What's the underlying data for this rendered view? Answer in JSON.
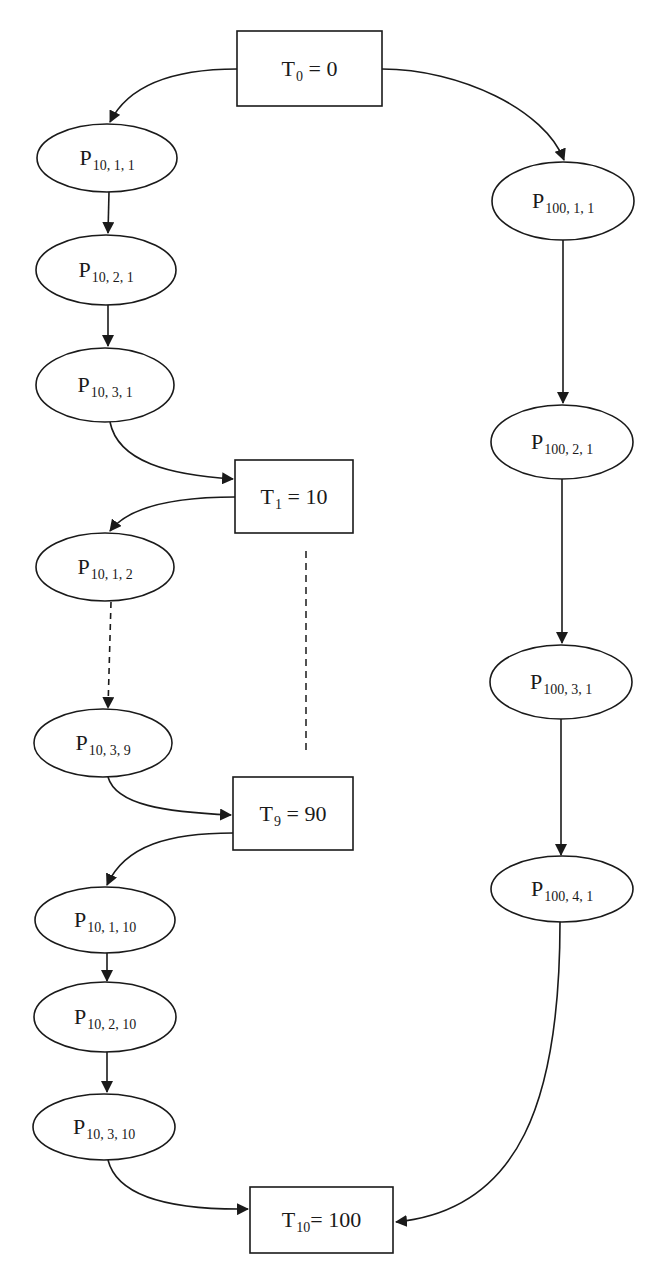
{
  "diagram": {
    "type": "flow",
    "colors": {
      "stroke": "#1a1a1a",
      "fill": "#ffffff",
      "background": "#ffffff"
    },
    "time_nodes": [
      {
        "id": "T0",
        "base": "T",
        "sub": "0",
        "rest": " = 0",
        "x": 237,
        "y": 31,
        "w": 145,
        "h": 75
      },
      {
        "id": "T1",
        "base": "T",
        "sub": "1",
        "rest": " = 10",
        "x": 235,
        "y": 460,
        "w": 118,
        "h": 73
      },
      {
        "id": "T9",
        "base": "T",
        "sub": "9",
        "rest": " = 90",
        "x": 233,
        "y": 777,
        "w": 120,
        "h": 73
      },
      {
        "id": "T10",
        "base": "T",
        "sub": "10",
        "rest": "= 100",
        "x": 250,
        "y": 1187,
        "w": 143,
        "h": 66
      }
    ],
    "process_nodes": [
      {
        "id": "P10_1_1",
        "base": "P",
        "sub": "10, 1, 1",
        "cx": 107,
        "cy": 158,
        "rx": 70,
        "ry": 34
      },
      {
        "id": "P10_2_1",
        "base": "P",
        "sub": "10, 2, 1",
        "cx": 106,
        "cy": 270,
        "rx": 70,
        "ry": 35
      },
      {
        "id": "P10_3_1",
        "base": "P",
        "sub": "10, 3, 1",
        "cx": 105,
        "cy": 385,
        "rx": 69,
        "ry": 37
      },
      {
        "id": "P10_1_2",
        "base": "P",
        "sub": "10, 1, 2",
        "cx": 105,
        "cy": 567,
        "rx": 69,
        "ry": 34
      },
      {
        "id": "P10_3_9",
        "base": "P",
        "sub": "10, 3, 9",
        "cx": 103,
        "cy": 743,
        "rx": 69,
        "ry": 34
      },
      {
        "id": "P10_1_10",
        "base": "P",
        "sub": "10, 1, 10",
        "cx": 105,
        "cy": 920,
        "rx": 70,
        "ry": 33
      },
      {
        "id": "P10_2_10",
        "base": "P",
        "sub": "10, 2, 10",
        "cx": 105,
        "cy": 1017,
        "rx": 71,
        "ry": 35
      },
      {
        "id": "P10_3_10",
        "base": "P",
        "sub": "10, 3, 10",
        "cx": 104,
        "cy": 1127,
        "rx": 71,
        "ry": 33
      },
      {
        "id": "P100_1_1",
        "base": "P",
        "sub": "100, 1, 1",
        "cx": 563,
        "cy": 201,
        "rx": 71,
        "ry": 39
      },
      {
        "id": "P100_2_1",
        "base": "P",
        "sub": "100, 2, 1",
        "cx": 562,
        "cy": 442,
        "rx": 71,
        "ry": 37
      },
      {
        "id": "P100_3_1",
        "base": "P",
        "sub": "100, 3, 1",
        "cx": 561,
        "cy": 682,
        "rx": 71,
        "ry": 37
      },
      {
        "id": "P100_4_1",
        "base": "P",
        "sub": "100, 4, 1",
        "cx": 562,
        "cy": 889,
        "rx": 71,
        "ry": 33
      }
    ],
    "edges": [
      {
        "from": "T0",
        "to": "P10_1_1",
        "d": "M237,69 C180,69 130,82 110,122",
        "style": "solid"
      },
      {
        "from": "T0",
        "to": "P100_1_1",
        "d": "M382,69 C460,69 545,110 564,160",
        "style": "solid"
      },
      {
        "from": "P10_1_1",
        "to": "P10_2_1",
        "d": "M109,192 L108,233",
        "style": "solid"
      },
      {
        "from": "P10_2_1",
        "to": "P10_3_1",
        "d": "M108,305 L108,346",
        "style": "solid"
      },
      {
        "from": "P10_3_1",
        "to": "T1",
        "d": "M110,422 C118,462 170,475 233,479",
        "style": "solid"
      },
      {
        "from": "T1",
        "to": "P10_1_2",
        "d": "M235,497 C180,497 130,505 110,531",
        "style": "solid"
      },
      {
        "from": "P10_1_2",
        "to": "P10_3_9",
        "d": "M111,602 L108,708",
        "style": "dashed"
      },
      {
        "from": "P10_3_9",
        "to": "T9",
        "d": "M108,777 C116,805 165,812 231,815",
        "style": "solid"
      },
      {
        "from": "T9",
        "to": "P10_1_10",
        "d": "M233,833 C170,833 125,845 107,885",
        "style": "solid"
      },
      {
        "from": "P10_1_10",
        "to": "P10_2_10",
        "d": "M107,953 L107,981",
        "style": "solid"
      },
      {
        "from": "P10_2_10",
        "to": "P10_3_10",
        "d": "M107,1052 L107,1092",
        "style": "solid"
      },
      {
        "from": "P10_3_10",
        "to": "T10",
        "d": "M108,1160 C118,1200 180,1210 248,1209",
        "style": "solid"
      },
      {
        "from": "P100_1_1",
        "to": "P100_2_1",
        "d": "M563,240 L563,403",
        "style": "solid"
      },
      {
        "from": "P100_2_1",
        "to": "P100_3_1",
        "d": "M562,479 L562,643",
        "style": "solid"
      },
      {
        "from": "P100_3_1",
        "to": "P100_4_1",
        "d": "M561,719 L561,855",
        "style": "solid"
      },
      {
        "from": "P100_4_1",
        "to": "T10",
        "d": "M560,922 C560,1100 520,1210 396,1222",
        "style": "solid"
      }
    ],
    "guides": [
      {
        "id": "ellipsis-T1-T9",
        "d": "M306,551 L306,753"
      }
    ]
  }
}
